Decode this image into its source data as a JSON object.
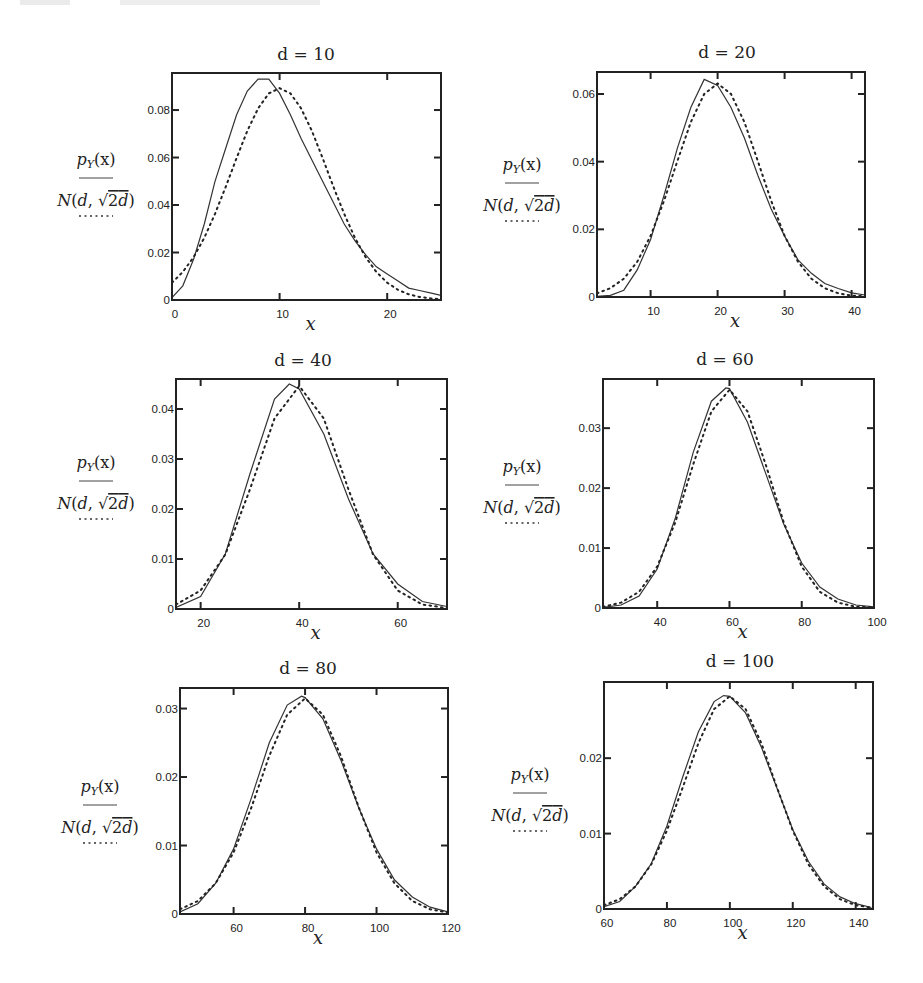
{
  "figure": {
    "series_labels": {
      "solid": "p_Y(x)",
      "dotted": "N(d, √2d)"
    },
    "legend_text": {
      "numerator_main": "p",
      "numerator_sub": "Y",
      "numerator_arg": "(x)",
      "denominator_N": "N",
      "denominator_open": "(",
      "denominator_d": "d",
      "denominator_comma": ", ",
      "denominator_sqrt": "√",
      "denominator_2": "2",
      "denominator_d2": "d",
      "denominator_close": ")"
    },
    "x_axis_label": "x"
  },
  "chart_data": [
    {
      "type": "line",
      "title": "d = 10",
      "d": 10,
      "xlabel": "x",
      "ylabel": "p_Y(x) / N(d, √2d)",
      "xlim": [
        0,
        25
      ],
      "ylim": [
        0,
        0.0956
      ],
      "xticks": [
        0,
        10,
        20
      ],
      "xtick_labels": [
        "0",
        "10",
        "20"
      ],
      "yticks": [
        0,
        0.02,
        0.04,
        0.06,
        0.08
      ],
      "ytick_labels": [
        "0",
        "0.02",
        "0.04",
        "0.06",
        "0.08"
      ],
      "grid": false,
      "frame": {
        "left": 172,
        "top": 73,
        "right": 441,
        "bottom": 300
      },
      "title_pos": {
        "x": 306,
        "y": 60
      },
      "label_pos": {
        "x": 96,
        "y": 165
      },
      "series": [
        {
          "name": "p_Y(x)",
          "style": "solid",
          "x": [
            0,
            1,
            2,
            3,
            4,
            5,
            6,
            7,
            8,
            9,
            10,
            11,
            12,
            13,
            14,
            15,
            16,
            17,
            18,
            19,
            20,
            21,
            22,
            23,
            24,
            25
          ],
          "y": [
            0.001,
            0.006,
            0.017,
            0.032,
            0.05,
            0.064,
            0.078,
            0.088,
            0.093,
            0.093,
            0.087,
            0.078,
            0.068,
            0.059,
            0.05,
            0.041,
            0.032,
            0.025,
            0.019,
            0.014,
            0.011,
            0.008,
            0.005,
            0.004,
            0.003,
            0.002
          ]
        },
        {
          "name": "N(d, √2d)",
          "style": "dotted",
          "x": [
            0,
            1,
            2,
            3,
            4,
            5,
            6,
            7,
            8,
            9,
            10,
            11,
            12,
            13,
            14,
            15,
            16,
            17,
            18,
            19,
            20,
            21,
            22,
            23,
            24,
            25
          ],
          "y": [
            0.0073,
            0.0118,
            0.018,
            0.0262,
            0.0363,
            0.0477,
            0.0598,
            0.0712,
            0.0807,
            0.087,
            0.0892,
            0.087,
            0.0807,
            0.0712,
            0.0598,
            0.0477,
            0.0363,
            0.0262,
            0.018,
            0.0118,
            0.0073,
            0.0043,
            0.0024,
            0.0013,
            0.0007,
            0.0003
          ]
        }
      ]
    },
    {
      "type": "line",
      "title": "d = 20",
      "d": 20,
      "xlabel": "x",
      "ylabel": "p_Y(x) / N(d, √2d)",
      "xlim": [
        2,
        42
      ],
      "ylim": [
        0,
        0.0665
      ],
      "xticks": [
        10,
        20,
        30,
        40
      ],
      "xtick_labels": [
        "10",
        "20",
        "30",
        "40"
      ],
      "yticks": [
        0,
        0.02,
        0.04,
        0.06
      ],
      "ytick_labels": [
        "0",
        "0.02",
        "0.04",
        "0.06"
      ],
      "grid": false,
      "frame": {
        "left": 597,
        "top": 72,
        "right": 865,
        "bottom": 297
      },
      "title_pos": {
        "x": 727,
        "y": 58
      },
      "label_pos": {
        "x": 522,
        "y": 170
      },
      "series": [
        {
          "name": "p_Y(x)",
          "style": "solid",
          "x": [
            2,
            4,
            6,
            8,
            10,
            12,
            14,
            16,
            18,
            20,
            22,
            24,
            26,
            28,
            30,
            32,
            34,
            36,
            38,
            40,
            42
          ],
          "y": [
            0.0002,
            0.0005,
            0.002,
            0.008,
            0.017,
            0.03,
            0.044,
            0.056,
            0.0643,
            0.0625,
            0.056,
            0.047,
            0.036,
            0.026,
            0.018,
            0.011,
            0.007,
            0.004,
            0.0025,
            0.0012,
            0.0006
          ]
        },
        {
          "name": "N(d, √2d)",
          "style": "dotted",
          "x": [
            2,
            4,
            6,
            8,
            10,
            12,
            14,
            16,
            18,
            20,
            22,
            24,
            26,
            28,
            30,
            32,
            34,
            36,
            38,
            40,
            42
          ],
          "y": [
            0.0011,
            0.0026,
            0.0054,
            0.0104,
            0.0181,
            0.0284,
            0.0402,
            0.0517,
            0.06,
            0.0631,
            0.06,
            0.0517,
            0.0402,
            0.0284,
            0.0181,
            0.0104,
            0.0054,
            0.0026,
            0.0011,
            0.0004,
            0.0002
          ]
        }
      ]
    },
    {
      "type": "line",
      "title": "d = 40",
      "d": 40,
      "xlabel": "x",
      "ylabel": "p_Y(x) / N(d, √2d)",
      "xlim": [
        15,
        70
      ],
      "ylim": [
        0,
        0.046
      ],
      "xticks": [
        20,
        40,
        60
      ],
      "xtick_labels": [
        "20",
        "40",
        "60"
      ],
      "yticks": [
        0,
        0.01,
        0.02,
        0.03,
        0.04
      ],
      "ytick_labels": [
        "0",
        "0.01",
        "0.02",
        "0.03",
        "0.04"
      ],
      "grid": false,
      "frame": {
        "left": 176,
        "top": 379,
        "right": 447,
        "bottom": 609
      },
      "title_pos": {
        "x": 303,
        "y": 366
      },
      "label_pos": {
        "x": 96,
        "y": 468
      },
      "series": [
        {
          "name": "p_Y(x)",
          "style": "solid",
          "x": [
            15,
            20,
            25,
            30,
            35,
            38,
            40,
            45,
            50,
            55,
            60,
            65,
            70
          ],
          "y": [
            0.0003,
            0.0025,
            0.011,
            0.027,
            0.042,
            0.045,
            0.044,
            0.035,
            0.022,
            0.011,
            0.005,
            0.0015,
            0.0005
          ]
        },
        {
          "name": "N(d, √2d)",
          "style": "dotted",
          "x": [
            15,
            20,
            25,
            30,
            35,
            40,
            45,
            50,
            55,
            60,
            65,
            70
          ],
          "y": [
            0.0009,
            0.0037,
            0.0109,
            0.0239,
            0.0381,
            0.0446,
            0.0381,
            0.0239,
            0.0109,
            0.0037,
            0.0009,
            0.0002
          ]
        }
      ]
    },
    {
      "type": "line",
      "title": "d = 60",
      "d": 60,
      "xlabel": "x",
      "ylabel": "p_Y(x) / N(d, √2d)",
      "xlim": [
        25,
        100
      ],
      "ylim": [
        0,
        0.0382
      ],
      "xticks": [
        40,
        60,
        80,
        100
      ],
      "xtick_labels": [
        "40",
        "60",
        "80",
        "100"
      ],
      "yticks": [
        0,
        0.01,
        0.02,
        0.03
      ],
      "ytick_labels": [
        "0",
        "0.01",
        "0.02",
        "0.03"
      ],
      "grid": false,
      "frame": {
        "left": 603,
        "top": 379,
        "right": 874,
        "bottom": 608
      },
      "title_pos": {
        "x": 725,
        "y": 365
      },
      "label_pos": {
        "x": 522,
        "y": 472
      },
      "series": [
        {
          "name": "p_Y(x)",
          "style": "solid",
          "x": [
            25,
            30,
            35,
            40,
            45,
            50,
            55,
            59,
            60,
            65,
            70,
            75,
            80,
            85,
            90,
            95,
            100
          ],
          "y": [
            0.0001,
            0.0005,
            0.002,
            0.0065,
            0.015,
            0.026,
            0.0345,
            0.0367,
            0.0366,
            0.031,
            0.0225,
            0.014,
            0.0075,
            0.0035,
            0.0015,
            0.0005,
            0.0002
          ]
        },
        {
          "name": "N(d, √2d)",
          "style": "dotted",
          "x": [
            25,
            30,
            35,
            40,
            45,
            50,
            55,
            60,
            65,
            70,
            75,
            80,
            85,
            90,
            95,
            100
          ],
          "y": [
            0.0002,
            0.0009,
            0.0027,
            0.0069,
            0.0143,
            0.024,
            0.0328,
            0.0364,
            0.0328,
            0.024,
            0.0143,
            0.0069,
            0.0027,
            0.0009,
            0.0002,
            0.0001
          ]
        }
      ]
    },
    {
      "type": "line",
      "title": "d = 80",
      "d": 80,
      "xlabel": "x",
      "ylabel": "p_Y(x) / N(d, √2d)",
      "xlim": [
        45,
        120
      ],
      "ylim": [
        0,
        0.033
      ],
      "xticks": [
        60,
        80,
        100,
        120
      ],
      "xtick_labels": [
        "60",
        "80",
        "100",
        "120"
      ],
      "yticks": [
        0,
        0.01,
        0.02,
        0.03
      ],
      "ytick_labels": [
        "0",
        "0.01",
        "0.02",
        "0.03"
      ],
      "grid": false,
      "frame": {
        "left": 180,
        "top": 688,
        "right": 448,
        "bottom": 914
      },
      "title_pos": {
        "x": 308,
        "y": 674
      },
      "label_pos": {
        "x": 100,
        "y": 792
      },
      "series": [
        {
          "name": "p_Y(x)",
          "style": "solid",
          "x": [
            45,
            50,
            55,
            60,
            65,
            70,
            75,
            79,
            80,
            85,
            90,
            95,
            100,
            105,
            110,
            115,
            120
          ],
          "y": [
            0.0003,
            0.0015,
            0.0045,
            0.0095,
            0.017,
            0.025,
            0.0305,
            0.0318,
            0.0316,
            0.0285,
            0.0225,
            0.0155,
            0.0095,
            0.005,
            0.0025,
            0.001,
            0.0003
          ]
        },
        {
          "name": "N(d, √2d)",
          "style": "dotted",
          "x": [
            45,
            50,
            55,
            60,
            65,
            70,
            75,
            80,
            85,
            90,
            95,
            100,
            105,
            110,
            115,
            120
          ],
          "y": [
            0.0007,
            0.0019,
            0.0045,
            0.009,
            0.0156,
            0.0231,
            0.0291,
            0.0315,
            0.0291,
            0.0231,
            0.0156,
            0.009,
            0.0045,
            0.0019,
            0.0007,
            0.0002
          ]
        }
      ]
    },
    {
      "type": "line",
      "title": "d = 100",
      "d": 100,
      "xlabel": "x",
      "ylabel": "p_Y(x) / N(d, √2d)",
      "xlim": [
        60,
        145.5
      ],
      "ylim": [
        0,
        0.0301
      ],
      "xticks": [
        60,
        80,
        100,
        120,
        140
      ],
      "xtick_labels": [
        "60",
        "80",
        "100",
        "120",
        "140"
      ],
      "yticks": [
        0,
        0.01,
        0.02
      ],
      "ytick_labels": [
        "0",
        "0.01",
        "0.02"
      ],
      "grid": false,
      "frame": {
        "left": 604,
        "top": 682,
        "right": 873,
        "bottom": 909
      },
      "title_pos": {
        "x": 740,
        "y": 667
      },
      "label_pos": {
        "x": 530,
        "y": 780
      },
      "series": [
        {
          "name": "p_Y(x)",
          "style": "solid",
          "x": [
            60,
            65,
            70,
            75,
            80,
            85,
            90,
            95,
            98,
            100,
            105,
            110,
            115,
            120,
            125,
            130,
            135,
            140,
            145
          ],
          "y": [
            0.0003,
            0.001,
            0.003,
            0.006,
            0.011,
            0.0175,
            0.0235,
            0.0275,
            0.0283,
            0.0282,
            0.026,
            0.0215,
            0.016,
            0.0105,
            0.0063,
            0.0033,
            0.0016,
            0.0007,
            0.0002
          ]
        },
        {
          "name": "N(d, √2d)",
          "style": "dotted",
          "x": [
            60,
            65,
            70,
            75,
            80,
            85,
            90,
            95,
            100,
            105,
            110,
            115,
            120,
            125,
            130,
            135,
            140,
            145
          ],
          "y": [
            0.0005,
            0.0013,
            0.003,
            0.0059,
            0.0104,
            0.0161,
            0.022,
            0.0265,
            0.0282,
            0.0265,
            0.022,
            0.0161,
            0.0104,
            0.0059,
            0.003,
            0.0013,
            0.0005,
            0.0002
          ]
        }
      ]
    }
  ]
}
